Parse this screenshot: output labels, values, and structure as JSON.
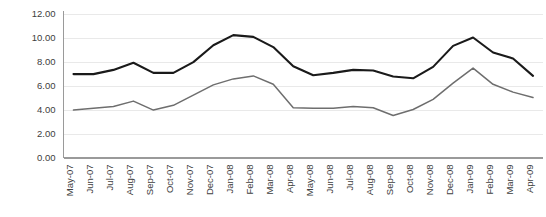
{
  "chart_data": {
    "type": "line",
    "title": "",
    "subtitle": "",
    "xlabel": "",
    "ylabel": "",
    "grid": true,
    "legend": "none",
    "ylim": [
      0,
      12
    ],
    "ytick_step": 2,
    "ytick_labels": [
      "0.00",
      "2.00",
      "4.00",
      "6.00",
      "8.00",
      "10.00",
      "12.00"
    ],
    "ytick_values": [
      0,
      2,
      4,
      6,
      8,
      10,
      12
    ],
    "categories": [
      "May-07",
      "Jun-07",
      "Jul-07",
      "Aug-07",
      "Sep-07",
      "Oct-07",
      "Nov-07",
      "Dec-07",
      "Jan-08",
      "Feb-08",
      "Mar-08",
      "Apr-08",
      "May-08",
      "Jun-08",
      "Jul-08",
      "Aug-08",
      "Sep-08",
      "Oct-08",
      "Nov-08",
      "Dec-08",
      "Jan-09",
      "Feb-09",
      "Mar-09",
      "Apr-09"
    ],
    "series": [
      {
        "name": "series-upper",
        "color": "#1a1a1a",
        "width": 2.1,
        "values": [
          6.95,
          6.95,
          7.3,
          7.9,
          7.05,
          7.05,
          7.95,
          9.35,
          10.2,
          10.05,
          9.2,
          7.6,
          6.85,
          7.05,
          7.3,
          7.25,
          6.75,
          6.6,
          7.55,
          9.3,
          10.0,
          8.75,
          8.25,
          6.8
        ]
      },
      {
        "name": "series-lower",
        "color": "#6e6e6e",
        "width": 1.5,
        "values": [
          3.95,
          4.1,
          4.25,
          4.7,
          3.95,
          4.35,
          5.2,
          6.05,
          6.55,
          6.8,
          6.1,
          4.15,
          4.1,
          4.1,
          4.25,
          4.15,
          3.5,
          4.0,
          4.85,
          6.2,
          7.45,
          6.1,
          5.45,
          5.0
        ]
      }
    ]
  }
}
